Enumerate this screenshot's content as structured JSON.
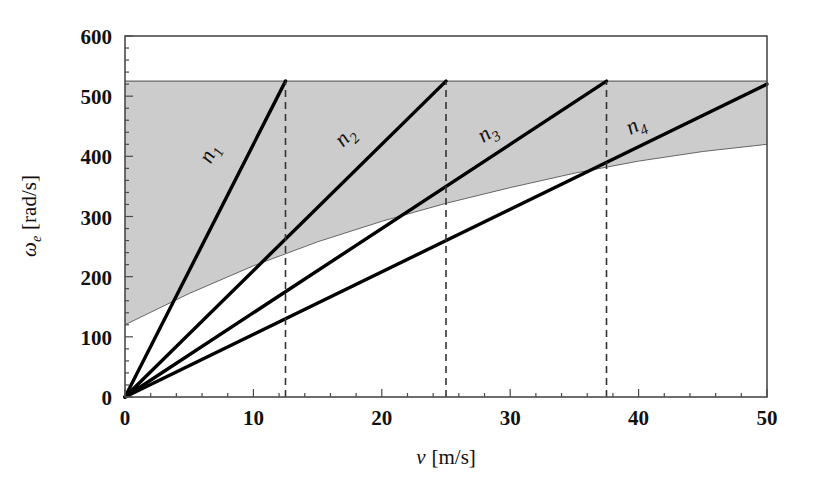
{
  "chart_data": {
    "type": "line",
    "title": "",
    "subtitle": "",
    "xlabel": "v [m/s]",
    "xlabel_symbol": "v",
    "xlabel_units": "[m/s]",
    "ylabel": "ωe [rad/s]",
    "ylabel_symbol": "ω",
    "ylabel_subscript": "e",
    "ylabel_units": "[rad/s]",
    "xlim": [
      0,
      50
    ],
    "ylim": [
      0,
      600
    ],
    "xticks": [
      0,
      10,
      20,
      30,
      40,
      50
    ],
    "xtick_labels": [
      "0",
      "10",
      "20",
      "30",
      "40",
      "50"
    ],
    "yticks": [
      0,
      100,
      200,
      300,
      400,
      500,
      600
    ],
    "ytick_labels": [
      "0",
      "100",
      "200",
      "300",
      "400",
      "500",
      "600"
    ],
    "x_minor_tick_step": 2,
    "y_minor_tick_step": 20,
    "grid": false,
    "legend": "inline-labels",
    "series": [
      {
        "name": "n1",
        "label": "n",
        "subscript": "1",
        "slope_rad_per_m": 42.0,
        "x": [
          0,
          12.5
        ],
        "values": [
          0,
          525
        ],
        "label_at": {
          "x": 7.0,
          "y": 400
        }
      },
      {
        "name": "n2",
        "label": "n",
        "subscript": "2",
        "slope_rad_per_m": 21.0,
        "x": [
          0,
          25.0
        ],
        "values": [
          0,
          525
        ],
        "label_at": {
          "x": 17.5,
          "y": 425
        }
      },
      {
        "name": "n3",
        "label": "n",
        "subscript": "3",
        "slope_rad_per_m": 14.0,
        "x": [
          0,
          37.5
        ],
        "values": [
          0,
          525
        ],
        "label_at": {
          "x": 28.5,
          "y": 430
        }
      },
      {
        "name": "n4",
        "label": "n",
        "subscript": "4",
        "slope_rad_per_m": 10.4,
        "x": [
          0,
          50.0
        ],
        "values": [
          0,
          520
        ],
        "label_at": {
          "x": 40.0,
          "y": 442
        }
      }
    ],
    "shaded_band": {
      "name": "operating-region",
      "color": "#cccccc",
      "upper_constant": 525,
      "lower_boundary_x": [
        0,
        5,
        10,
        15,
        20,
        25,
        30,
        35,
        40,
        45,
        50
      ],
      "lower_boundary_y": [
        120,
        172,
        218,
        258,
        292,
        322,
        348,
        372,
        392,
        408,
        420
      ]
    },
    "vertical_markers": [
      {
        "name": "shift-point-1",
        "x": 12.5,
        "y_top": 525,
        "style": "dashed"
      },
      {
        "name": "shift-point-2",
        "x": 25.0,
        "y_top": 525,
        "style": "dashed"
      },
      {
        "name": "shift-point-3",
        "x": 37.5,
        "y_top": 525,
        "style": "dashed"
      }
    ],
    "colors": {
      "line": "#000000",
      "band": "#cccccc",
      "band_edge": "#555555",
      "frame": "#4a4a4a",
      "dashed": "#333333"
    }
  }
}
